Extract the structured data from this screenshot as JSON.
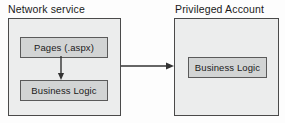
{
  "diagram": {
    "type": "architecture-block-diagram",
    "background_color": "#fdfdfd",
    "containers": [
      {
        "id": "network-service",
        "title": "Network service",
        "fill_color": "#eceded",
        "border_color": "#4a4a4a",
        "nodes": [
          {
            "id": "pages",
            "label": "Pages (.aspx)"
          },
          {
            "id": "business-logic-left",
            "label": "Business Logic"
          }
        ]
      },
      {
        "id": "privileged-account",
        "title": "Privileged Account",
        "fill_color": "#eceded",
        "border_color": "#4a4a4a",
        "nodes": [
          {
            "id": "business-logic-right",
            "label": "Business Logic"
          }
        ]
      }
    ],
    "connectors": [
      {
        "id": "pages-to-business-logic",
        "direction": "down",
        "from": "pages",
        "to": "business-logic-left",
        "label": "",
        "color": "#333333"
      },
      {
        "id": "network-service-to-privileged-account",
        "direction": "right",
        "from": "network-service",
        "to": "privileged-account",
        "label": "",
        "color": "#333333"
      }
    ]
  }
}
